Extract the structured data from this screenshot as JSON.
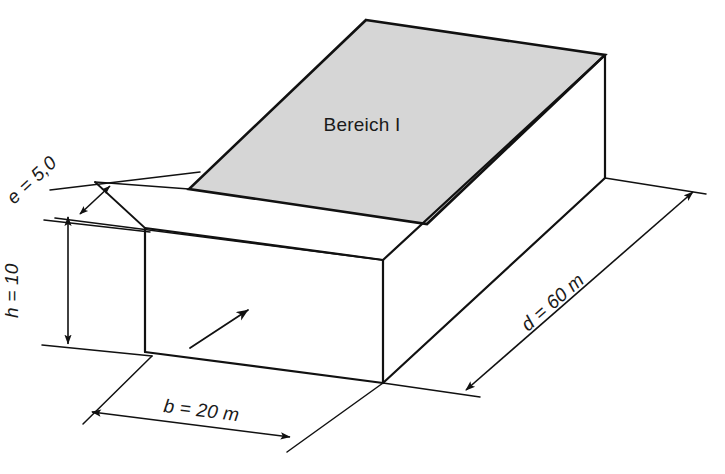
{
  "figure": {
    "title": "Bereich I",
    "background_color": "#ffffff",
    "line_color": "#111111",
    "top_face_fill": "#d6d6d6",
    "area_label": {
      "name": "area-label",
      "text": "Bereich I",
      "style": "upright"
    },
    "dimensions": [
      {
        "id": "e",
        "name": "dimension-e",
        "text": "e = 5,0",
        "symbol": "e",
        "value": "5,0",
        "unit": "",
        "orientation": "slanted",
        "arrows": "double"
      },
      {
        "id": "h",
        "name": "dimension-h",
        "text": "h = 10",
        "symbol": "h",
        "value": "10",
        "unit": "",
        "orientation": "vertical",
        "arrows": "double"
      },
      {
        "id": "b",
        "name": "dimension-b",
        "text": "b = 20 m",
        "symbol": "b",
        "value": "20",
        "unit": "m",
        "orientation": "horizontal",
        "arrows": "double"
      },
      {
        "id": "d",
        "name": "dimension-d",
        "text": "d = 60 m",
        "symbol": "d",
        "value": "60",
        "unit": "m",
        "orientation": "diagonal",
        "arrows": "double"
      }
    ],
    "wind_arrow": {
      "name": "wind-direction-arrow",
      "label": ""
    }
  }
}
